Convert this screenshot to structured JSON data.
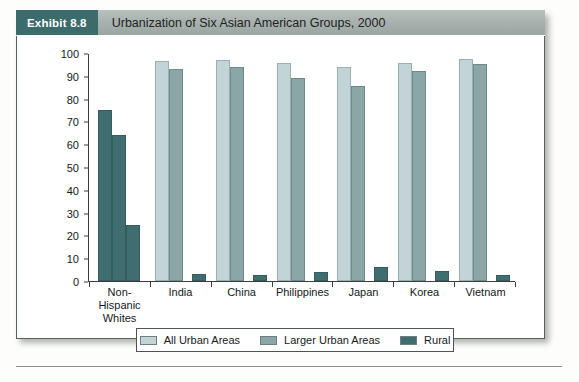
{
  "exhibit": {
    "badge": "Exhibit 8.8",
    "title": "Urbanization of Six Asian American Groups, 2000"
  },
  "colors": {
    "badge_bg": "#3c6b6b",
    "header_bg": "#a9b2af",
    "all_urban": "#c2d4d5",
    "larger_urban": "#8aa6a7",
    "rural": "#3f6d70",
    "axis": "#3a3f3e",
    "panel_border": "#58605e"
  },
  "chart_data": {
    "type": "bar",
    "title": "Urbanization of Six Asian American Groups, 2000",
    "xlabel": "",
    "ylabel": "",
    "ylim": [
      0,
      100
    ],
    "yticks": [
      0,
      10,
      20,
      30,
      40,
      50,
      60,
      70,
      80,
      90,
      100
    ],
    "grid": false,
    "legend_position": "bottom",
    "categories": [
      "Non-Hispanic Whites",
      "India",
      "China",
      "Philippines",
      "Japan",
      "Korea",
      "Vietnam"
    ],
    "series": [
      {
        "name": "All Urban Areas",
        "color": "#c2d4d5",
        "values": [
          75,
          96.5,
          97,
          95.5,
          94,
          95.5,
          97.5
        ]
      },
      {
        "name": "Larger Urban Areas",
        "color": "#8aa6a7",
        "values": [
          64,
          93,
          94,
          89,
          85.5,
          92,
          95
        ]
      },
      {
        "name": "Rural",
        "color": "#3f6d70",
        "values": [
          24.5,
          3,
          2.5,
          4,
          6,
          4.5,
          2.5
        ]
      }
    ]
  },
  "axis": {
    "y_tick_labels": [
      "100",
      "90",
      "80",
      "70",
      "60",
      "50",
      "40",
      "30",
      "20",
      "10",
      "0"
    ]
  },
  "x_labels": [
    {
      "line1": "Non-Hispanic",
      "line2": "Whites"
    },
    {
      "line1": "India",
      "line2": ""
    },
    {
      "line1": "China",
      "line2": ""
    },
    {
      "line1": "Philippines",
      "line2": ""
    },
    {
      "line1": "Japan",
      "line2": ""
    },
    {
      "line1": "Korea",
      "line2": ""
    },
    {
      "line1": "Vietnam",
      "line2": ""
    }
  ],
  "legend": {
    "items": [
      {
        "label": "All Urban Areas",
        "color": "#c2d4d5"
      },
      {
        "label": "Larger Urban Areas",
        "color": "#8aa6a7"
      },
      {
        "label": "Rural",
        "color": "#3f6d70"
      }
    ]
  }
}
